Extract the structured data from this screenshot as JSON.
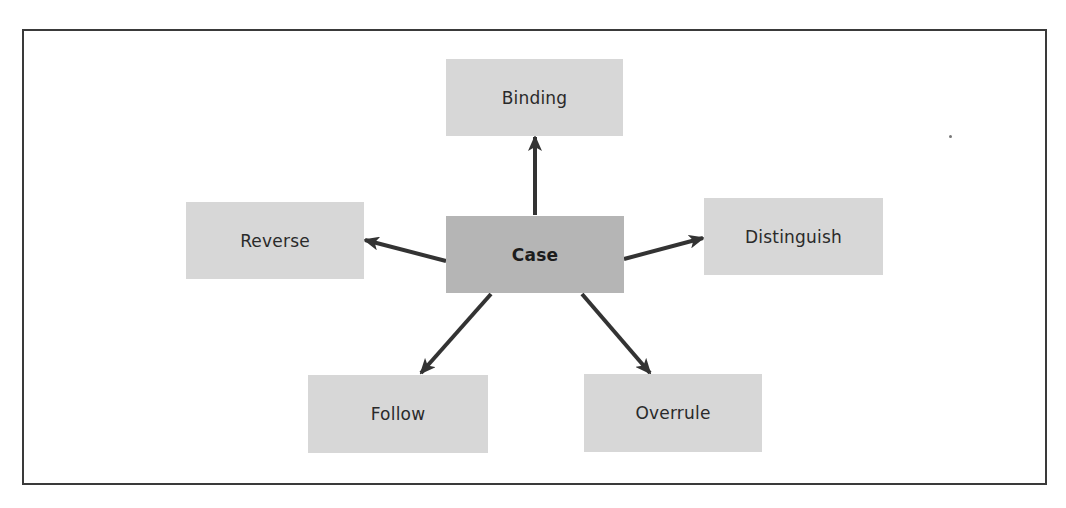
{
  "diagram": {
    "title": "",
    "center": {
      "label": "Case"
    },
    "nodes": [
      {
        "id": "binding",
        "label": "Binding"
      },
      {
        "id": "reverse",
        "label": "Reverse"
      },
      {
        "id": "distinguish",
        "label": "Distinguish"
      },
      {
        "id": "follow",
        "label": "Follow"
      },
      {
        "id": "overrule",
        "label": "Overrule"
      }
    ],
    "edges": [
      {
        "from": "Case",
        "to": "Binding"
      },
      {
        "from": "Case",
        "to": "Reverse"
      },
      {
        "from": "Case",
        "to": "Distinguish"
      },
      {
        "from": "Case",
        "to": "Follow"
      },
      {
        "from": "Case",
        "to": "Overrule"
      }
    ],
    "colors": {
      "center_fill": "#b5b5b5",
      "node_fill": "#d7d7d7",
      "arrow": "#333333",
      "frame": "#3a3a3a"
    }
  }
}
